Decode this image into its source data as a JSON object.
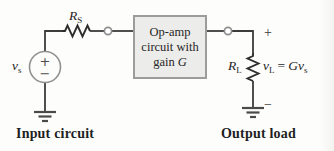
{
  "diagram": {
    "box": {
      "line1": "Op-amp",
      "line2": "circuit with",
      "line3_word": "gain",
      "gain_symbol": "G"
    },
    "source": {
      "symbol": "v",
      "subscript": "s",
      "plus": "+",
      "minus": "−"
    },
    "resistor_series": {
      "symbol": "R",
      "subscript": "S"
    },
    "resistor_load": {
      "symbol": "R",
      "subscript": "L"
    },
    "output": {
      "plus": "+",
      "minus": "−",
      "expr_v": "v",
      "expr_v_sub": "L",
      "expr_equals": "=",
      "expr_gain": "G",
      "expr_vs": "v",
      "expr_vs_sub": "s"
    },
    "captions": {
      "input": "Input circuit",
      "output": "Output load"
    }
  },
  "colors": {
    "wire": "#3c3c3c",
    "resistor": "#2e2e2e",
    "source_circle": "#909090",
    "node_stroke": "#8f8f8f",
    "box_fill": "#ececea",
    "box_border": "#9c9c9c",
    "ground": "#4a4a4a",
    "text": "#1f1f1f"
  }
}
